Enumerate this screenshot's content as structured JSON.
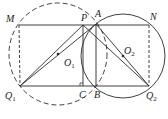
{
  "diagram": {
    "points": {
      "M": {
        "label": "M",
        "x": 19,
        "y": 25
      },
      "N": {
        "label": "N",
        "x": 149,
        "y": 25
      },
      "P": {
        "label": "P",
        "x": 83,
        "y": 25
      },
      "A": {
        "label": "A",
        "x": 96,
        "y": 24
      },
      "Q1": {
        "label": "Q",
        "sub": "1",
        "x": 20,
        "y": 86
      },
      "Q2": {
        "label": "Q",
        "sub": "2",
        "x": 149,
        "y": 86
      },
      "C": {
        "label": "C",
        "x": 83,
        "y": 86
      },
      "B": {
        "label": "B",
        "x": 96,
        "y": 86
      },
      "O1": {
        "label": "O",
        "sub": "1",
        "x": 58,
        "y": 54
      },
      "O2": {
        "label": "O",
        "sub": "2",
        "x": 122,
        "y": 55
      }
    },
    "circles": [
      {
        "name": "circle-O1",
        "style": "dashed"
      },
      {
        "name": "circle-O2",
        "style": "solid"
      }
    ],
    "stroke_color": "#2a2a2a"
  }
}
